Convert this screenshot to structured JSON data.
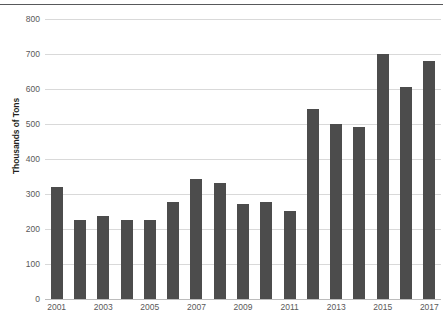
{
  "chart_data": {
    "type": "bar",
    "title": "",
    "subtitle": "",
    "xlabel": "",
    "ylabel": "Thousands of Tons",
    "categories": [
      "2001",
      "2002",
      "2003",
      "2004",
      "2005",
      "2006",
      "2007",
      "2008",
      "2009",
      "2010",
      "2011",
      "2012",
      "2013",
      "2014",
      "2015",
      "2016",
      "2017"
    ],
    "values": [
      320,
      226,
      238,
      226,
      225,
      277,
      343,
      332,
      271,
      277,
      251,
      542,
      499,
      491,
      701,
      605,
      681
    ],
    "x_tick_labels": [
      "2001",
      "2003",
      "2005",
      "2007",
      "2009",
      "2011",
      "2013",
      "2015",
      "2017"
    ],
    "y_tick_labels": [
      "0",
      "100",
      "200",
      "300",
      "400",
      "500",
      "600",
      "700",
      "800"
    ],
    "y_ticks": [
      0,
      100,
      200,
      300,
      400,
      500,
      600,
      700,
      800
    ],
    "ylim": [
      0,
      800
    ],
    "grid": "horizontal",
    "legend": "none",
    "bar_color": "#4c4c4c",
    "grid_color": "#d9d9d9",
    "text_color": "#595959"
  }
}
